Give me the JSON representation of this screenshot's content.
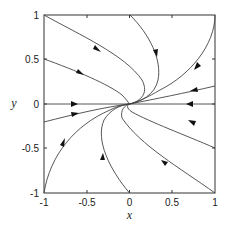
{
  "figure": {
    "type": "phase_portrait",
    "xlabel": "x",
    "ylabel": "y",
    "xlim": [
      -1,
      1
    ],
    "ylim": [
      -1,
      1
    ],
    "x_ticks": [
      "-1",
      "-0.5",
      "0",
      "0.5",
      "1"
    ],
    "y_ticks": [
      "1",
      "0.5",
      "0",
      "-0.5",
      "-1"
    ],
    "equilibrium": {
      "x": 0,
      "y": 0,
      "type": "stable node"
    },
    "trajectories": [
      {
        "id": "A",
        "start": [
          -1,
          1
        ],
        "end": [
          0,
          0
        ]
      },
      {
        "id": "B",
        "start": [
          -1,
          0.5
        ],
        "end": [
          0,
          0
        ]
      },
      {
        "id": "C",
        "start": [
          -1,
          0
        ],
        "end": [
          0,
          0
        ]
      },
      {
        "id": "D",
        "start": [
          -1,
          -0.2
        ],
        "end": [
          0,
          0
        ]
      },
      {
        "id": "E",
        "start": [
          -1,
          -1
        ],
        "end": [
          0,
          0
        ]
      },
      {
        "id": "F",
        "start": [
          0,
          -1
        ],
        "end": [
          0,
          0
        ]
      },
      {
        "id": "G",
        "start": [
          0,
          1
        ],
        "end": [
          0,
          0
        ]
      },
      {
        "id": "H",
        "start": [
          1,
          1
        ],
        "end": [
          0,
          0
        ]
      },
      {
        "id": "I",
        "start": [
          1,
          0.2
        ],
        "end": [
          0,
          0
        ]
      },
      {
        "id": "J",
        "start": [
          1,
          0
        ],
        "end": [
          0,
          0
        ]
      },
      {
        "id": "K",
        "start": [
          1,
          -0.35
        ],
        "end": [
          0,
          0
        ]
      },
      {
        "id": "L",
        "start": [
          1,
          -1
        ],
        "end": [
          0,
          0
        ]
      }
    ]
  }
}
